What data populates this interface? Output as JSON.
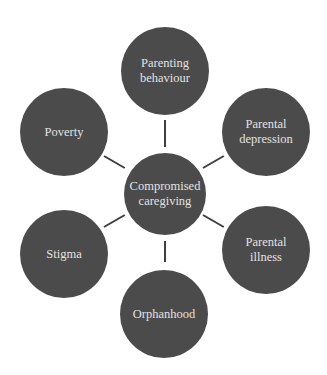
{
  "diagram": {
    "type": "hub-and-spoke",
    "colors": {
      "node_fill": "#4b4b4b",
      "node_text": "#e2e2e2",
      "connector": "#3e3e3e",
      "background": "#ffffff"
    },
    "center": {
      "label": "Compromised\ncaregiving"
    },
    "nodes": [
      {
        "label": "Parenting\nbehaviour"
      },
      {
        "label": "Parental\ndepression"
      },
      {
        "label": "Parental\nillness"
      },
      {
        "label": "Orphanhood"
      },
      {
        "label": "Stigma"
      },
      {
        "label": "Poverty"
      }
    ]
  }
}
